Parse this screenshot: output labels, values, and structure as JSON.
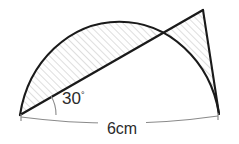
{
  "figure": {
    "kind": "geometry-diagram",
    "background_color": "#ffffff",
    "stroke_color": "#1a1a1a",
    "thin_stroke_color": "#7a7a7a",
    "hatch_color": "#d6d6d6",
    "text_color": "#2b2b2b",
    "labels": {
      "angle_value": "30",
      "angle_unit": "°",
      "diameter_label": "6cm"
    },
    "geometry": {
      "left_vertex": [
        20,
        115
      ],
      "right_vertex": [
        219,
        114
      ],
      "apex": [
        203,
        10
      ],
      "arc_peak": [
        130,
        8
      ],
      "chord_arc_crossing": [
        168,
        22
      ],
      "angle_degrees": 30,
      "diameter_cm": 6
    }
  }
}
